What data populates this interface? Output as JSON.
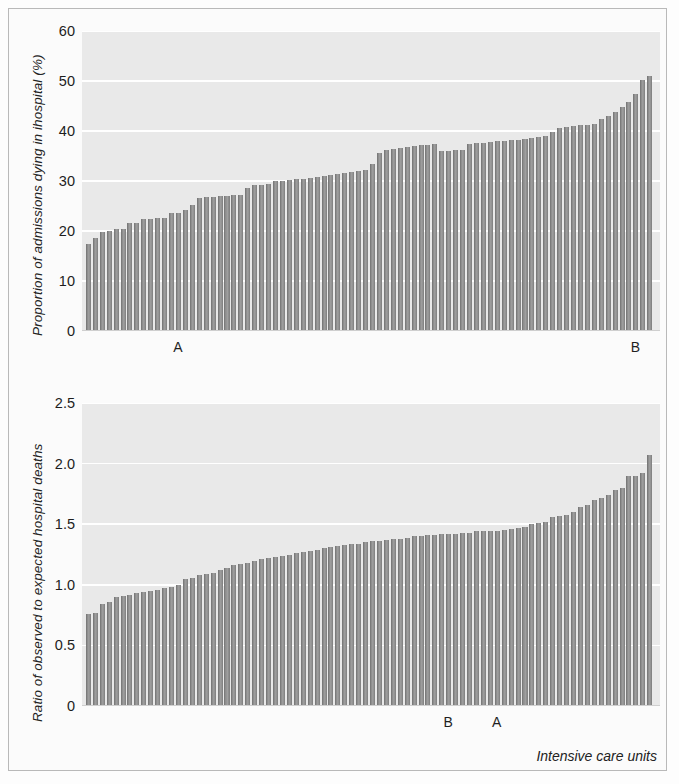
{
  "figure": {
    "background": "#fdfdfd",
    "plot_background": "#e9e9e9",
    "bar_color": "#8e8e8e",
    "gridline_color": "#ffffff",
    "xlabel": "Intensive care units"
  },
  "chart_data": [
    {
      "id": "top",
      "type": "bar",
      "title": "",
      "xlabel": "",
      "ylabel": "Proportion of admissions dying in ihospital (%)",
      "ylim": [
        0,
        60
      ],
      "yticks": [
        0,
        10,
        20,
        30,
        40,
        50,
        60
      ],
      "ytick_labels": [
        "0",
        "10",
        "20",
        "30",
        "40",
        "50",
        "60"
      ],
      "grid": true,
      "legend": "none",
      "annotations": [
        {
          "label": "A",
          "bar_index": 13
        },
        {
          "label": "B",
          "bar_index": 79
        }
      ],
      "categories_note": "82 intensive care units, sorted ascending",
      "values": [
        17.5,
        18.6,
        19.9,
        20.1,
        20.4,
        20.5,
        21.6,
        21.7,
        22.4,
        22.5,
        22.6,
        22.7,
        23.6,
        23.7,
        24.3,
        25.3,
        26.6,
        26.8,
        26.9,
        27.0,
        27.1,
        27.2,
        27.3,
        28.6,
        29.2,
        29.3,
        29.4,
        30.0,
        30.1,
        30.3,
        30.4,
        30.5,
        30.6,
        30.8,
        31.0,
        31.3,
        31.4,
        31.6,
        31.8,
        32.0,
        32.2,
        33.4,
        35.6,
        36.2,
        36.4,
        36.6,
        36.8,
        37.0,
        37.2,
        37.3,
        37.4,
        36.0,
        36.1,
        36.2,
        36.3,
        37.5,
        37.6,
        37.7,
        37.8,
        38.0,
        38.1,
        38.2,
        38.3,
        38.4,
        38.6,
        38.8,
        39.0,
        39.9,
        40.6,
        40.8,
        41.0,
        41.2,
        41.3,
        41.4,
        42.4,
        43.0,
        43.9,
        44.8,
        45.8,
        47.4,
        50.2,
        51.0
      ]
    },
    {
      "id": "bottom",
      "type": "bar",
      "title": "",
      "xlabel": "Intensive care units",
      "ylabel": "Ratio of observed to expected hospital deaths",
      "ylim": [
        0,
        2.5
      ],
      "yticks": [
        0,
        0.5,
        1.0,
        1.5,
        2.0,
        2.5
      ],
      "ytick_labels": [
        "0",
        "0.5",
        "1.0",
        "1.5",
        "2.0",
        "2.5"
      ],
      "grid": true,
      "legend": "none",
      "annotations": [
        {
          "label": "B",
          "bar_index": 52
        },
        {
          "label": "A",
          "bar_index": 59
        }
      ],
      "categories_note": "82 intensive care units, sorted ascending",
      "values": [
        0.76,
        0.77,
        0.84,
        0.86,
        0.9,
        0.91,
        0.92,
        0.93,
        0.94,
        0.95,
        0.96,
        0.97,
        0.98,
        1.0,
        1.05,
        1.06,
        1.08,
        1.09,
        1.1,
        1.12,
        1.14,
        1.16,
        1.17,
        1.18,
        1.2,
        1.21,
        1.22,
        1.23,
        1.24,
        1.25,
        1.26,
        1.27,
        1.28,
        1.29,
        1.3,
        1.31,
        1.32,
        1.33,
        1.34,
        1.34,
        1.35,
        1.36,
        1.36,
        1.37,
        1.38,
        1.38,
        1.39,
        1.4,
        1.4,
        1.41,
        1.41,
        1.42,
        1.42,
        1.42,
        1.43,
        1.43,
        1.44,
        1.44,
        1.44,
        1.44,
        1.45,
        1.46,
        1.47,
        1.48,
        1.5,
        1.51,
        1.52,
        1.56,
        1.57,
        1.58,
        1.6,
        1.64,
        1.66,
        1.7,
        1.72,
        1.74,
        1.78,
        1.8,
        1.9,
        1.9,
        1.92,
        2.07
      ]
    }
  ]
}
